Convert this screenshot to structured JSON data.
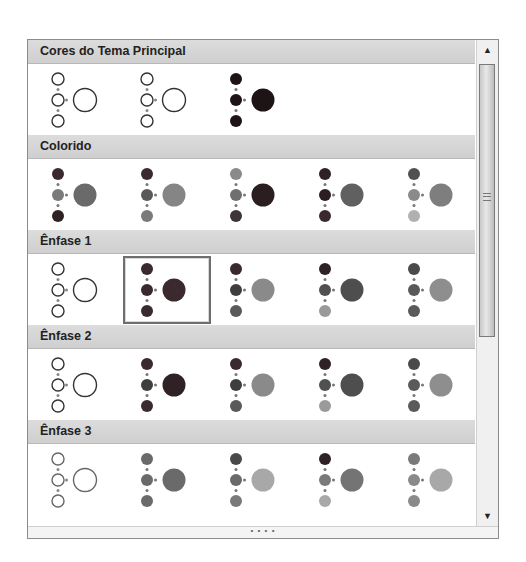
{
  "gallery": {
    "sections": [
      {
        "title": "Cores do Tema Principal",
        "items": [
          {
            "style": "outline",
            "small": [
              "#ffffff",
              "#ffffff",
              "#ffffff"
            ],
            "big": "#ffffff",
            "stroke": "#333333"
          },
          {
            "style": "outline",
            "small": [
              "#ffffff",
              "#ffffff",
              "#ffffff"
            ],
            "big": "#ffffff",
            "stroke": "#333333"
          },
          {
            "style": "filled",
            "small": [
              "#1e1416",
              "#1e1416",
              "#1e1416"
            ],
            "big": "#1e1416",
            "stroke": "none"
          }
        ]
      },
      {
        "title": "Colorido",
        "items": [
          {
            "style": "filled",
            "small": [
              "#3a2a2e",
              "#7a7a7a",
              "#2e2224"
            ],
            "big": "#6a6a6a",
            "stroke": "none"
          },
          {
            "style": "filled",
            "small": [
              "#3a2a2e",
              "#595959",
              "#7a7a7a"
            ],
            "big": "#858585",
            "stroke": "none"
          },
          {
            "style": "filled",
            "small": [
              "#8a8a8a",
              "#6f6f6f",
              "#3e3538"
            ],
            "big": "#2a1e20",
            "stroke": "none"
          },
          {
            "style": "filled",
            "small": [
              "#2e2224",
              "#2a1e20",
              "#3a2a2e"
            ],
            "big": "#606060",
            "stroke": "none"
          },
          {
            "style": "filled",
            "small": [
              "#505050",
              "#8a8a8a",
              "#b0b0b0"
            ],
            "big": "#7e7e7e",
            "stroke": "none"
          }
        ]
      },
      {
        "title": "Ênfase 1",
        "items": [
          {
            "style": "outline",
            "small": [
              "#ffffff",
              "#ffffff",
              "#ffffff"
            ],
            "big": "#ffffff",
            "stroke": "#333333"
          },
          {
            "style": "filled",
            "small": [
              "#3a2a2e",
              "#3a2a2e",
              "#3a2a2e"
            ],
            "big": "#3a2a2e",
            "stroke": "none",
            "selected": true
          },
          {
            "style": "filled",
            "small": [
              "#3a2a2e",
              "#3e3e3e",
              "#5a5a5a"
            ],
            "big": "#8a8a8a",
            "stroke": "none"
          },
          {
            "style": "filled",
            "small": [
              "#2e2224",
              "#505050",
              "#9a9a9a"
            ],
            "big": "#4e4e4e",
            "stroke": "none"
          },
          {
            "style": "filled",
            "small": [
              "#4a4a4a",
              "#5a5a5a",
              "#5a5a5a"
            ],
            "big": "#8e8e8e",
            "stroke": "none"
          }
        ]
      },
      {
        "title": "Ênfase 2",
        "items": [
          {
            "style": "outline",
            "small": [
              "#ffffff",
              "#ffffff",
              "#ffffff"
            ],
            "big": "#ffffff",
            "stroke": "#333333"
          },
          {
            "style": "filled",
            "small": [
              "#3a2a2e",
              "#3e3e3e",
              "#3a2a2e"
            ],
            "big": "#2e2224",
            "stroke": "none"
          },
          {
            "style": "filled",
            "small": [
              "#3a2a2e",
              "#3e3e3e",
              "#5a5a5a"
            ],
            "big": "#8a8a8a",
            "stroke": "none"
          },
          {
            "style": "filled",
            "small": [
              "#2e2224",
              "#505050",
              "#9a9a9a"
            ],
            "big": "#4e4e4e",
            "stroke": "none"
          },
          {
            "style": "filled",
            "small": [
              "#4a4a4a",
              "#5a5a5a",
              "#5a5a5a"
            ],
            "big": "#8e8e8e",
            "stroke": "none"
          }
        ]
      },
      {
        "title": "Ênfase 3",
        "items": [
          {
            "style": "outline",
            "small": [
              "#ffffff",
              "#ffffff",
              "#ffffff"
            ],
            "big": "#ffffff",
            "stroke": "#666666"
          },
          {
            "style": "filled",
            "small": [
              "#6a6a6a",
              "#6a6a6a",
              "#6a6a6a"
            ],
            "big": "#6a6a6a",
            "stroke": "none"
          },
          {
            "style": "filled",
            "small": [
              "#4a4a4a",
              "#6a6a6a",
              "#7a7a7a"
            ],
            "big": "#a8a8a8",
            "stroke": "none"
          },
          {
            "style": "filled",
            "small": [
              "#2e2224",
              "#7a7a7a",
              "#a8a8a8"
            ],
            "big": "#747474",
            "stroke": "none"
          },
          {
            "style": "filled",
            "small": [
              "#7a7a7a",
              "#8a8a8a",
              "#8a8a8a"
            ],
            "big": "#a8a8a8",
            "stroke": "none"
          }
        ]
      }
    ],
    "footer_grip": "• • • •",
    "scroll": {
      "up_arrow": "▲",
      "down_arrow": "▼"
    }
  }
}
